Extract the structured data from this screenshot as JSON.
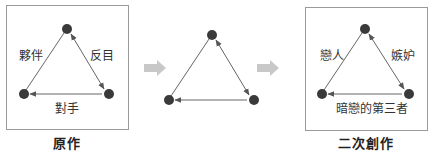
{
  "panels": {
    "original": {
      "caption": "原作",
      "edges": {
        "left": "夥伴",
        "right": "反目",
        "bottom": "對手"
      }
    },
    "middle": {
      "caption": ""
    },
    "derivative": {
      "caption": "二次創作",
      "edges": {
        "left": "戀人",
        "right": "嫉妒",
        "bottom": "暗戀的第三者"
      }
    }
  },
  "icons": {
    "transition_arrows": [
      "right-arrow-icon",
      "right-arrow-icon"
    ],
    "node": "filled-circle"
  },
  "colors": {
    "node": "#3a3a3a",
    "edge": "#555555",
    "panel_border": "#9a9a9a",
    "transition_arrow": "#c8c8c8",
    "text": "#333333"
  }
}
